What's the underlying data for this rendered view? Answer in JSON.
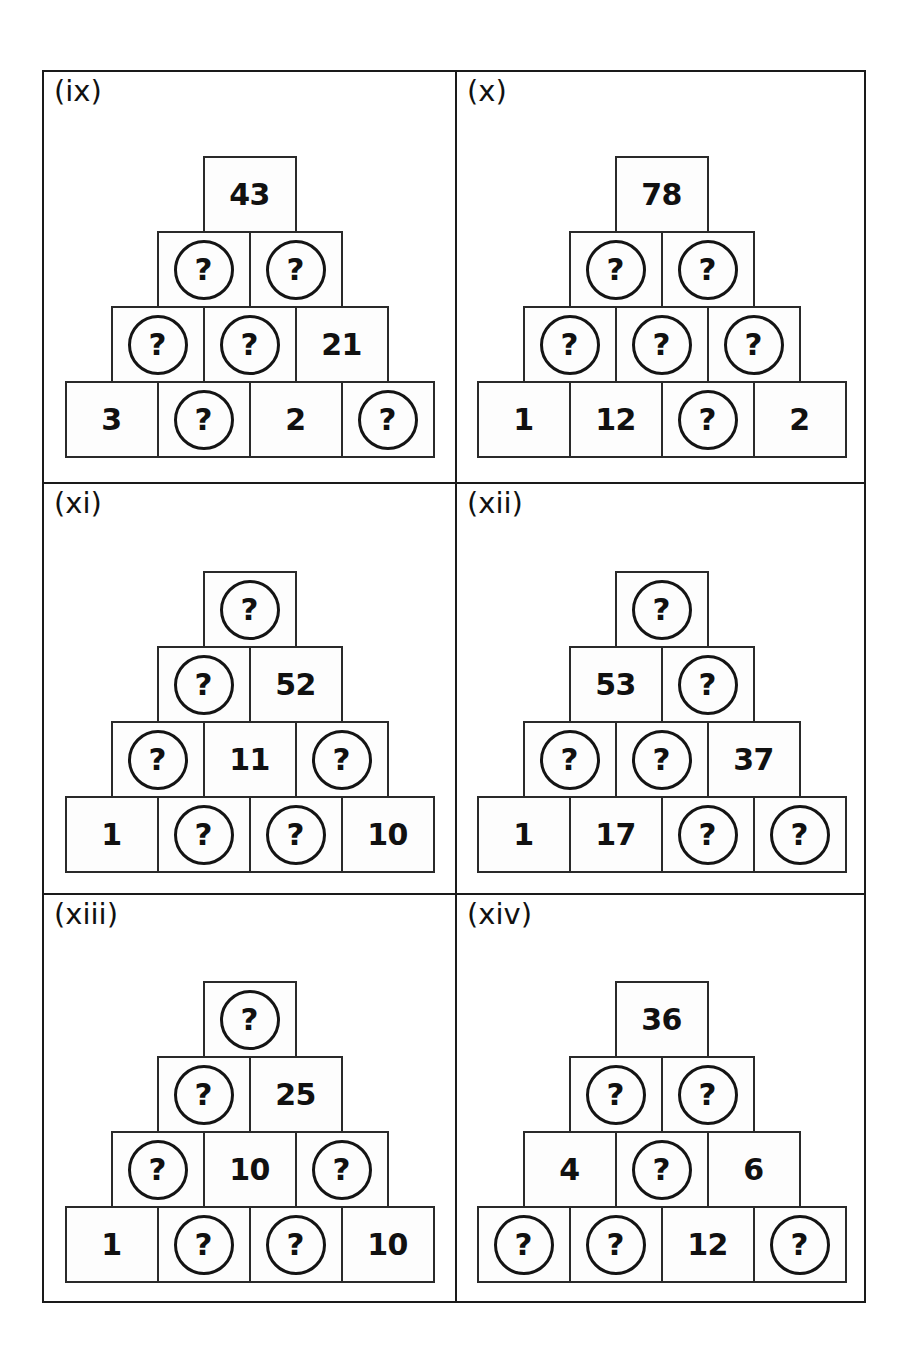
{
  "sheet": {
    "question_symbol": "?",
    "panels": [
      {
        "label": "(ix)",
        "rows": [
          [
            "43"
          ],
          [
            "?",
            "?"
          ],
          [
            "?",
            "?",
            "21"
          ],
          [
            "3",
            "?",
            "2",
            "?"
          ]
        ]
      },
      {
        "label": "(x)",
        "rows": [
          [
            "78"
          ],
          [
            "?",
            "?"
          ],
          [
            "?",
            "?",
            "?"
          ],
          [
            "1",
            "12",
            "?",
            "2"
          ]
        ]
      },
      {
        "label": "(xi)",
        "rows": [
          [
            "?"
          ],
          [
            "?",
            "52"
          ],
          [
            "?",
            "11",
            "?"
          ],
          [
            "1",
            "?",
            "?",
            "10"
          ]
        ]
      },
      {
        "label": "(xii)",
        "rows": [
          [
            "?"
          ],
          [
            "53",
            "?"
          ],
          [
            "?",
            "?",
            "37"
          ],
          [
            "1",
            "17",
            "?",
            "?"
          ]
        ]
      },
      {
        "label": "(xiii)",
        "rows": [
          [
            "?"
          ],
          [
            "?",
            "25"
          ],
          [
            "?",
            "10",
            "?"
          ],
          [
            "1",
            "?",
            "?",
            "10"
          ]
        ]
      },
      {
        "label": "(xiv)",
        "rows": [
          [
            "36"
          ],
          [
            "?",
            "?"
          ],
          [
            "4",
            "?",
            "6"
          ],
          [
            "?",
            "?",
            "12",
            "?"
          ]
        ]
      }
    ]
  }
}
